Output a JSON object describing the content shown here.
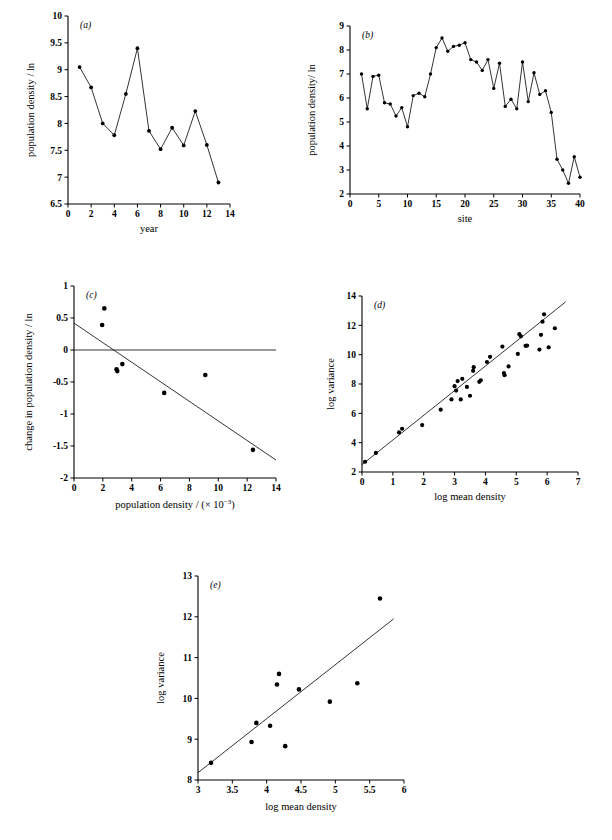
{
  "figure": {
    "background_color": "#ffffff",
    "ink_color": "#000000",
    "panel_count": 5
  },
  "panels": {
    "a": {
      "tag": "(a)",
      "ylabel": "population density / ln",
      "xlabel": "year"
    },
    "b": {
      "tag": "(b)",
      "ylabel": "population density/ ln",
      "xlabel": "site"
    },
    "c": {
      "tag": "(c)",
      "ylabel": "change in population density / ln",
      "xlabel_main": "population density / (× 10",
      "xlabel_exp": "−3",
      "xlabel_tail": ")"
    },
    "d": {
      "tag": "(d)",
      "ylabel": "log variance",
      "xlabel": "log mean density"
    },
    "e": {
      "tag": "(e)",
      "ylabel": "log variance",
      "xlabel": "log mean density"
    }
  },
  "chart_data": [
    {
      "id": "a",
      "type": "line",
      "title": "(a)",
      "xlabel": "year",
      "ylabel": "population density / ln",
      "xlim": [
        0,
        14
      ],
      "ylim": [
        6.5,
        10
      ],
      "xticks": [
        0,
        2,
        4,
        6,
        8,
        10,
        12,
        14
      ],
      "yticks": [
        6.5,
        7,
        7.5,
        8,
        8.5,
        9,
        9.5,
        10
      ],
      "grid": false,
      "markers": true,
      "x": [
        1,
        2,
        3,
        4,
        5,
        6,
        7,
        8,
        9,
        10,
        11,
        12,
        13
      ],
      "values": [
        9.05,
        8.67,
        8.0,
        7.78,
        8.55,
        9.4,
        7.86,
        7.52,
        7.92,
        7.59,
        8.23,
        7.6,
        6.9
      ]
    },
    {
      "id": "b",
      "type": "line",
      "title": "(b)",
      "xlabel": "site",
      "ylabel": "population density/ ln",
      "xlim": [
        0,
        40
      ],
      "ylim": [
        2,
        9
      ],
      "xticks": [
        0,
        5,
        10,
        15,
        20,
        25,
        30,
        35,
        40
      ],
      "yticks": [
        2,
        3,
        4,
        5,
        6,
        7,
        8,
        9
      ],
      "grid": false,
      "markers": true,
      "x": [
        2,
        3,
        4,
        5,
        6,
        7,
        8,
        9,
        10,
        11,
        12,
        13,
        14,
        15,
        16,
        17,
        18,
        19,
        20,
        21,
        22,
        23,
        24,
        25,
        26,
        27,
        28,
        29,
        30,
        31,
        32,
        33,
        34,
        35,
        36,
        37,
        38,
        39,
        40
      ],
      "values": [
        7.0,
        5.55,
        6.9,
        6.95,
        5.8,
        5.75,
        5.25,
        5.6,
        4.8,
        6.1,
        6.2,
        6.05,
        7.0,
        8.1,
        8.5,
        7.95,
        8.15,
        8.2,
        8.3,
        7.6,
        7.5,
        7.15,
        7.6,
        6.4,
        7.45,
        5.65,
        5.95,
        5.55,
        7.5,
        5.85,
        7.05,
        6.15,
        6.3,
        5.4,
        3.45,
        3.0,
        2.45,
        3.55,
        2.7
      ]
    },
    {
      "id": "c",
      "type": "scatter",
      "title": "(c)",
      "xlabel": "population density / (× 10⁻³)",
      "ylabel": "change in population density / ln",
      "xlim": [
        0,
        14
      ],
      "ylim": [
        -2,
        1
      ],
      "xticks": [
        0,
        2,
        4,
        6,
        8,
        10,
        12,
        14
      ],
      "yticks": [
        -2,
        -1.5,
        -1,
        -0.5,
        0,
        0.5,
        1
      ],
      "grid": false,
      "zero_line": true,
      "points": [
        {
          "x": 2.1,
          "y": 0.65
        },
        {
          "x": 1.95,
          "y": 0.39
        },
        {
          "x": 2.95,
          "y": -0.3
        },
        {
          "x": 3.0,
          "y": -0.33
        },
        {
          "x": 3.35,
          "y": -0.22
        },
        {
          "x": 6.25,
          "y": -0.67
        },
        {
          "x": 9.1,
          "y": -0.39
        },
        {
          "x": 12.4,
          "y": -1.56
        }
      ],
      "fit_line": {
        "x0": 0,
        "y0": 0.42,
        "x1": 14,
        "y1": -1.72
      }
    },
    {
      "id": "d",
      "type": "scatter",
      "title": "(d)",
      "xlabel": "log mean density",
      "ylabel": "log variance",
      "xlim": [
        0,
        7
      ],
      "ylim": [
        2,
        14
      ],
      "xticks": [
        0,
        1,
        2,
        3,
        4,
        5,
        6,
        7
      ],
      "yticks": [
        2,
        4,
        6,
        8,
        10,
        12,
        14
      ],
      "grid": false,
      "points": [
        {
          "x": 0.1,
          "y": 2.7
        },
        {
          "x": 0.45,
          "y": 3.3
        },
        {
          "x": 1.2,
          "y": 4.7
        },
        {
          "x": 1.3,
          "y": 4.95
        },
        {
          "x": 1.95,
          "y": 5.2
        },
        {
          "x": 2.55,
          "y": 6.25
        },
        {
          "x": 2.9,
          "y": 6.95
        },
        {
          "x": 3.05,
          "y": 7.55
        },
        {
          "x": 3.0,
          "y": 7.85
        },
        {
          "x": 3.1,
          "y": 8.2
        },
        {
          "x": 3.2,
          "y": 6.95
        },
        {
          "x": 3.25,
          "y": 8.35
        },
        {
          "x": 3.4,
          "y": 7.8
        },
        {
          "x": 3.5,
          "y": 7.2
        },
        {
          "x": 3.6,
          "y": 8.9
        },
        {
          "x": 3.62,
          "y": 9.15
        },
        {
          "x": 3.8,
          "y": 8.15
        },
        {
          "x": 3.85,
          "y": 8.25
        },
        {
          "x": 4.05,
          "y": 9.5
        },
        {
          "x": 4.15,
          "y": 9.85
        },
        {
          "x": 4.55,
          "y": 10.55
        },
        {
          "x": 4.6,
          "y": 8.75
        },
        {
          "x": 4.62,
          "y": 8.6
        },
        {
          "x": 4.75,
          "y": 9.2
        },
        {
          "x": 5.05,
          "y": 10.05
        },
        {
          "x": 5.1,
          "y": 11.4
        },
        {
          "x": 5.15,
          "y": 11.25
        },
        {
          "x": 5.3,
          "y": 10.6
        },
        {
          "x": 5.35,
          "y": 10.62
        },
        {
          "x": 5.75,
          "y": 10.35
        },
        {
          "x": 5.8,
          "y": 11.35
        },
        {
          "x": 5.85,
          "y": 12.25
        },
        {
          "x": 5.9,
          "y": 12.75
        },
        {
          "x": 6.05,
          "y": 10.5
        },
        {
          "x": 6.25,
          "y": 11.8
        }
      ],
      "fit_line": {
        "x0": 0.0,
        "y0": 2.5,
        "x1": 6.6,
        "y1": 13.6
      }
    },
    {
      "id": "e",
      "type": "scatter",
      "title": "(e)",
      "xlabel": "log mean density",
      "ylabel": "log variance",
      "xlim": [
        3,
        6
      ],
      "ylim": [
        8,
        13
      ],
      "xticks": [
        3,
        3.5,
        4,
        4.5,
        5,
        5.5,
        6
      ],
      "yticks": [
        8,
        9,
        10,
        11,
        12,
        13
      ],
      "grid": false,
      "points": [
        {
          "x": 3.19,
          "y": 8.42
        },
        {
          "x": 3.78,
          "y": 8.93
        },
        {
          "x": 3.85,
          "y": 9.4
        },
        {
          "x": 4.05,
          "y": 9.33
        },
        {
          "x": 4.15,
          "y": 10.34
        },
        {
          "x": 4.18,
          "y": 10.6
        },
        {
          "x": 4.27,
          "y": 8.83
        },
        {
          "x": 4.47,
          "y": 10.22
        },
        {
          "x": 4.92,
          "y": 9.92
        },
        {
          "x": 5.32,
          "y": 10.37
        },
        {
          "x": 5.65,
          "y": 12.45
        }
      ],
      "fit_line": {
        "x0": 3.0,
        "y0": 8.18,
        "x1": 5.85,
        "y1": 11.95
      }
    }
  ]
}
